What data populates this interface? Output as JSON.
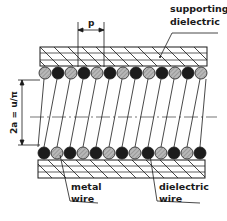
{
  "diagram": {
    "labels": {
      "supporting_dielectric_line1": "supporting",
      "supporting_dielectric_line2": "dielectric",
      "metal_wire_line1": "metal",
      "metal_wire_line2": "wire",
      "dielectric_wire_line1": "dielectric",
      "dielectric_wire_line2": "wire",
      "pitch": "p",
      "diameter": "2a = u/π"
    },
    "wires": {
      "top_row_count": 13,
      "top_row_first": "dielectric",
      "bottom_row_count": 13,
      "bottom_row_first": "metal",
      "metal_color": "#1c1c1c",
      "dielectric_color": "#b8b8b8"
    },
    "colors": {
      "line": "#1a1a1a",
      "background": "#ffffff"
    }
  }
}
